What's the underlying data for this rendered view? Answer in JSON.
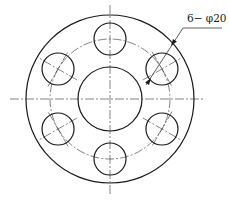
{
  "drawing": {
    "title": "Flange with bolt-hole pattern",
    "annotation": {
      "text": "6− φ20",
      "count": 6,
      "symbol": "φ",
      "diameter": 20,
      "position": {
        "x": 186,
        "y": 13
      }
    },
    "colors": {
      "line": "#1a1a1a",
      "centerline": "#333333",
      "background": "#ffffff"
    },
    "geometry": {
      "center": {
        "x": 110,
        "y": 99
      },
      "outer_circle_radius": 84,
      "bolt_circle_radius": 60,
      "center_hole_radius": 32,
      "bolt_hole_radius": 16,
      "bolt_hole_angles_deg": [
        90,
        30,
        -30,
        -90,
        -150,
        150
      ],
      "horizontal_centerline": {
        "x1": 10,
        "x2": 205
      },
      "vertical_centerline": {
        "y1": 5,
        "y2": 194
      }
    },
    "leader": {
      "points": [
        [
          146,
          85
        ],
        [
          183,
          28
        ],
        [
          222,
          28
        ]
      ],
      "arrow_outer": {
        "x": 172,
        "y": 45,
        "angle": 124
      },
      "arrow_inner": {
        "x": 150,
        "y": 80,
        "angle": -56
      }
    }
  }
}
